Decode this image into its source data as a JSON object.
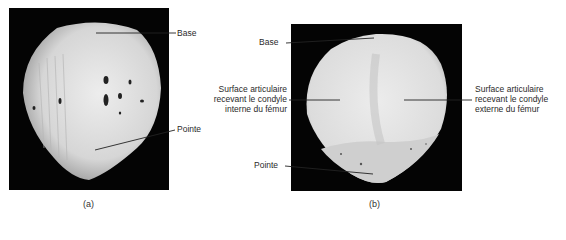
{
  "figure_a": {
    "caption": "(a)",
    "labels": {
      "base": "Base",
      "pointe": "Pointe"
    }
  },
  "figure_b": {
    "caption": "(b)",
    "labels": {
      "base": "Base",
      "pointe": "Pointe",
      "medial_line1": "Surface articulaire",
      "medial_line2": "recevant le condyle",
      "medial_line3": "interne du fémur",
      "lateral_line1": "Surface articulaire",
      "lateral_line2": "recevant le condyle",
      "lateral_line3": "externe du fémur"
    }
  },
  "colors": {
    "background": "#ffffff",
    "frame": "#040404",
    "bone": "#e4e4e4",
    "leader": "#222222"
  }
}
